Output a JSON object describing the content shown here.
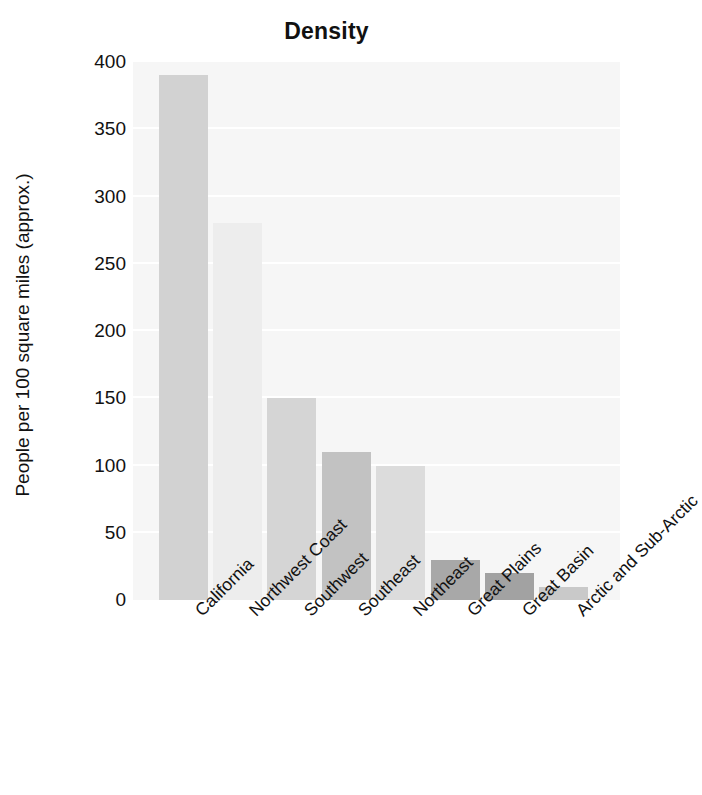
{
  "chart_data": {
    "type": "bar",
    "title": "Density",
    "xlabel": "",
    "ylabel": "People per 100 square miles (approx.)",
    "categories": [
      "California",
      "Northwest Coast",
      "Southwest",
      "Southeast",
      "Northeast",
      "Great Plains",
      "Great Basin",
      "Arctic and Sub-Arctic"
    ],
    "values": [
      390,
      280,
      150,
      110,
      100,
      30,
      20,
      10
    ],
    "bar_colors": [
      "#d2d2d2",
      "#ededed",
      "#d5d5d5",
      "#c2c2c2",
      "#dcdcdc",
      "#a8a8a8",
      "#a2a2a2",
      "#c9c9c9"
    ],
    "ylim": [
      0,
      400
    ],
    "yticks": [
      0,
      50,
      100,
      150,
      200,
      250,
      300,
      350,
      400
    ],
    "ytick_labels": [
      "0",
      "50",
      "100",
      "150",
      "200",
      "250",
      "300",
      "350",
      "400"
    ],
    "grid": true,
    "grid_color": "#ffffff",
    "plot_background": "#f6f6f6",
    "figure_background": "#ffffff",
    "legend": null,
    "xtick_rotation": 45
  }
}
